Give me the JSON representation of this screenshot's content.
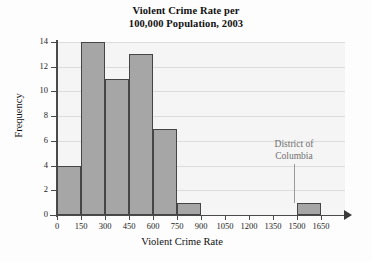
{
  "chart_data": {
    "type": "bar",
    "title": "Violent Crime Rate per 100,000 Population, 2003",
    "title_lines": [
      "Violent Crime Rate per",
      "100,000 Population, 2003"
    ],
    "xlabel": "Violent Crime Rate",
    "ylabel": "Frequency",
    "xlim": [
      0,
      1800
    ],
    "ylim": [
      0,
      14
    ],
    "grid": true,
    "legend": null,
    "bin_width": 150,
    "categories": [
      "0-150",
      "150-300",
      "300-450",
      "450-600",
      "600-750",
      "750-900",
      "900-1050",
      "1050-1200",
      "1200-1350",
      "1350-1500",
      "1500-1650"
    ],
    "bin_edges": [
      0,
      150,
      300,
      450,
      600,
      750,
      900,
      1050,
      1200,
      1350,
      1500,
      1650
    ],
    "values": [
      4,
      14,
      11,
      13,
      7,
      1,
      0,
      0,
      0,
      0,
      1
    ],
    "xticks": [
      0,
      150,
      300,
      450,
      600,
      750,
      900,
      1050,
      1200,
      1350,
      1500,
      1650
    ],
    "xtick_labels": [
      "0",
      "150",
      "300",
      "450",
      "600",
      "750",
      "900",
      "1050",
      "1200",
      "1350",
      "1500",
      "1650"
    ],
    "yticks": [
      0,
      2,
      4,
      6,
      8,
      10,
      12,
      14
    ],
    "ytick_labels": [
      "0",
      "2",
      "4",
      "6",
      "8",
      "10",
      "12",
      "14"
    ],
    "annotations": [
      {
        "text": "District of Columbia",
        "lines": [
          "District of",
          "Columbia"
        ],
        "points_to_bin": "1500-1650",
        "value": 1
      }
    ],
    "colors": {
      "bar_fill": "#a6a6a6",
      "bar_edge": "#454545",
      "plot_background": "#f5f5f5",
      "gridline": "#dcdcdc",
      "axis": "#4a4a4a",
      "annotation_text": "#6f6f6f"
    }
  }
}
